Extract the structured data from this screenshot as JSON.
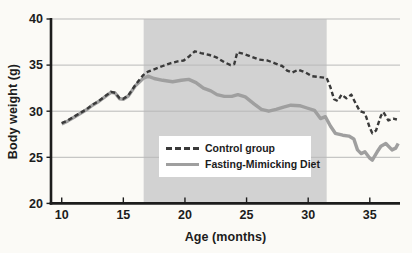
{
  "chart_data": {
    "type": "line",
    "title": "",
    "xlabel": "Age (months)",
    "ylabel": "Body weight (g)",
    "xlim": [
      9.13,
      37.45
    ],
    "ylim": [
      20,
      40
    ],
    "x_ticks": [
      10,
      15,
      20,
      25,
      30,
      35
    ],
    "y_ticks": [
      20,
      25,
      30,
      35,
      40
    ],
    "grid": "horizontal",
    "legend_position": "center-bottom-inside",
    "shaded_region": {
      "x_start": 16.65,
      "x_end": 31.5,
      "color": "#d2d2d2"
    },
    "colors": {
      "background": "#fbfaf6",
      "grid": "#b9b9b9",
      "axis": "#1c1c1c",
      "legend_bg": "#ffffff"
    },
    "series": [
      {
        "name": "Fasting-Mimicking Diet",
        "style": "solid",
        "color": "#9f9f9f",
        "points": [
          [
            10,
            28.6
          ],
          [
            10.5,
            28.95
          ],
          [
            11,
            29.35
          ],
          [
            11.5,
            29.75
          ],
          [
            12,
            30.15
          ],
          [
            12.5,
            30.65
          ],
          [
            13,
            31.05
          ],
          [
            13.5,
            31.55
          ],
          [
            14,
            32.05
          ],
          [
            14.35,
            31.95
          ],
          [
            14.7,
            31.35
          ],
          [
            15.0,
            31.3
          ],
          [
            15.4,
            31.65
          ],
          [
            16,
            32.8
          ],
          [
            16.6,
            33.55
          ],
          [
            17,
            33.8
          ],
          [
            17.5,
            33.55
          ],
          [
            18.2,
            33.35
          ],
          [
            19.0,
            33.2
          ],
          [
            19.7,
            33.35
          ],
          [
            20.3,
            33.45
          ],
          [
            20.9,
            33.1
          ],
          [
            21.5,
            32.5
          ],
          [
            22.1,
            32.2
          ],
          [
            22.6,
            31.8
          ],
          [
            23.2,
            31.6
          ],
          [
            23.8,
            31.6
          ],
          [
            24.3,
            31.8
          ],
          [
            24.9,
            31.55
          ],
          [
            25.6,
            30.8
          ],
          [
            26.2,
            30.2
          ],
          [
            26.8,
            30.0
          ],
          [
            27.4,
            30.2
          ],
          [
            28.0,
            30.45
          ],
          [
            28.6,
            30.65
          ],
          [
            29.3,
            30.6
          ],
          [
            29.9,
            30.35
          ],
          [
            30.5,
            30.1
          ],
          [
            31.0,
            29.2
          ],
          [
            31.4,
            29.4
          ],
          [
            31.8,
            28.4
          ],
          [
            32.2,
            27.6
          ],
          [
            32.8,
            27.4
          ],
          [
            33.3,
            27.3
          ],
          [
            33.7,
            27.0
          ],
          [
            34.0,
            25.8
          ],
          [
            34.3,
            25.4
          ],
          [
            34.6,
            25.6
          ],
          [
            35.0,
            24.9
          ],
          [
            35.2,
            24.7
          ],
          [
            35.6,
            25.6
          ],
          [
            35.9,
            26.2
          ],
          [
            36.3,
            26.5
          ],
          [
            36.8,
            25.8
          ],
          [
            37.1,
            26.0
          ],
          [
            37.3,
            26.5
          ]
        ]
      },
      {
        "name": "Control group",
        "style": "dashed",
        "color": "#3a3a3a",
        "points": [
          [
            10,
            28.7
          ],
          [
            10.5,
            29.0
          ],
          [
            11,
            29.4
          ],
          [
            11.5,
            29.8
          ],
          [
            12,
            30.2
          ],
          [
            12.5,
            30.7
          ],
          [
            13,
            31.1
          ],
          [
            13.5,
            31.6
          ],
          [
            14,
            32.1
          ],
          [
            14.35,
            32.0
          ],
          [
            14.7,
            31.4
          ],
          [
            15.0,
            31.35
          ],
          [
            15.4,
            31.7
          ],
          [
            16,
            32.9
          ],
          [
            16.6,
            33.9
          ],
          [
            17,
            34.3
          ],
          [
            17.6,
            34.6
          ],
          [
            18.2,
            34.9
          ],
          [
            18.8,
            35.2
          ],
          [
            19.4,
            35.4
          ],
          [
            19.9,
            35.5
          ],
          [
            20.3,
            35.9
          ],
          [
            20.8,
            36.5
          ],
          [
            21.3,
            36.3
          ],
          [
            22,
            36.1
          ],
          [
            22.6,
            35.8
          ],
          [
            23.2,
            35.3
          ],
          [
            23.7,
            35.0
          ],
          [
            24.0,
            35.1
          ],
          [
            24.25,
            36.4
          ],
          [
            24.8,
            36.2
          ],
          [
            25.4,
            35.9
          ],
          [
            26.0,
            35.6
          ],
          [
            26.7,
            35.5
          ],
          [
            27.3,
            35.2
          ],
          [
            27.9,
            34.9
          ],
          [
            28.3,
            34.4
          ],
          [
            28.7,
            34.2
          ],
          [
            29.2,
            34.5
          ],
          [
            29.8,
            34.2
          ],
          [
            30.3,
            33.8
          ],
          [
            30.9,
            33.7
          ],
          [
            31.5,
            33.6
          ],
          [
            31.8,
            32.6
          ],
          [
            32.1,
            31.3
          ],
          [
            32.4,
            31.1
          ],
          [
            32.7,
            31.8
          ],
          [
            33.1,
            31.4
          ],
          [
            33.5,
            31.8
          ],
          [
            33.9,
            30.7
          ],
          [
            34.2,
            30.0
          ],
          [
            34.6,
            29.8
          ],
          [
            35.0,
            28.2
          ],
          [
            35.2,
            27.6
          ],
          [
            35.5,
            27.9
          ],
          [
            35.9,
            29.5
          ],
          [
            36.1,
            29.9
          ],
          [
            36.5,
            29.0
          ],
          [
            36.9,
            29.2
          ],
          [
            37.2,
            29.1
          ]
        ]
      }
    ]
  }
}
